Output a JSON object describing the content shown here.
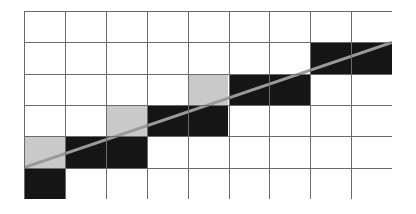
{
  "figure": {
    "title": "",
    "type": "raster-grid-line-diagram"
  },
  "grid": {
    "columns": 9,
    "rows": 6,
    "origin_x": 24,
    "origin_y": 11,
    "cell_width": 40.9,
    "cell_height": 31.33,
    "line_color": "#6b6b6b",
    "line_width": 1,
    "background_color": "#ffffff",
    "border_color": "#8a8a8a"
  },
  "colors": {
    "dark": "#151515",
    "light": "#c9c9c9",
    "empty": "#ffffff",
    "stroke": "#6b6b6b",
    "diagonal": "#9a9a9a"
  },
  "filled_cells": [
    {
      "col": 7,
      "row": 1,
      "shade": "dark"
    },
    {
      "col": 8,
      "row": 1,
      "shade": "dark"
    },
    {
      "col": 4,
      "row": 2,
      "shade": "light"
    },
    {
      "col": 5,
      "row": 2,
      "shade": "dark"
    },
    {
      "col": 6,
      "row": 2,
      "shade": "dark"
    },
    {
      "col": 2,
      "row": 3,
      "shade": "light"
    },
    {
      "col": 3,
      "row": 3,
      "shade": "dark"
    },
    {
      "col": 4,
      "row": 3,
      "shade": "dark"
    },
    {
      "col": 0,
      "row": 4,
      "shade": "light"
    },
    {
      "col": 1,
      "row": 4,
      "shade": "dark"
    },
    {
      "col": 2,
      "row": 4,
      "shade": "dark"
    },
    {
      "col": 0,
      "row": 5,
      "shade": "dark"
    }
  ],
  "diagonal_line": {
    "x1": 24,
    "y1": 167.7,
    "x2": 392,
    "y2": 42.3,
    "color": "#9a9a9a",
    "width": 3
  },
  "chart_data": {
    "type": "heatmap",
    "title": "",
    "xlabel": "",
    "ylabel": "",
    "columns": 9,
    "rows": 6,
    "legend": [],
    "cells": [
      [
        0,
        0,
        0,
        0,
        0,
        0,
        0,
        0,
        0
      ],
      [
        0,
        0,
        0,
        0,
        0,
        0,
        0,
        2,
        2
      ],
      [
        0,
        0,
        0,
        0,
        1,
        2,
        2,
        0,
        0
      ],
      [
        0,
        0,
        1,
        2,
        2,
        0,
        0,
        0,
        0
      ],
      [
        1,
        2,
        2,
        0,
        0,
        0,
        0,
        0,
        0
      ],
      [
        2,
        0,
        0,
        0,
        0,
        0,
        0,
        0,
        0
      ]
    ],
    "value_legend": {
      "0": "empty",
      "1": "light-gray",
      "2": "black"
    }
  }
}
